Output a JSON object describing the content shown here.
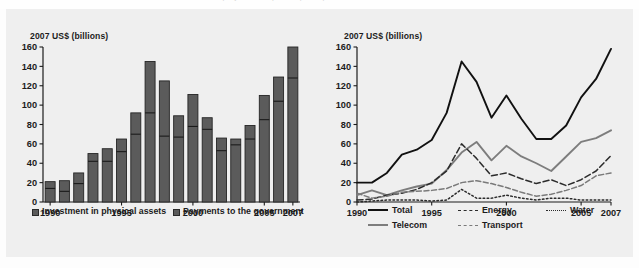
{
  "page": {
    "cropped_caption_ghost": "Investment in infrastructure projects with private participation"
  },
  "figure": {
    "left_panel": {
      "axis_title": "2007 US$ (billions)",
      "y_ticks": [
        "0",
        "20",
        "40",
        "60",
        "80",
        "100",
        "120",
        "140",
        "160"
      ],
      "x_ticks": [
        "1990",
        "1995",
        "2000",
        "2005",
        "2007"
      ],
      "legend": [
        {
          "label": "Investment in physical assets",
          "color": "#5b5b5b"
        },
        {
          "label": "Payments to the government",
          "color": "#5b5b5b"
        }
      ]
    },
    "right_panel": {
      "axis_title": "2007 US$ (billions)",
      "y_ticks": [
        "0",
        "20",
        "40",
        "60",
        "80",
        "100",
        "120",
        "140",
        "160"
      ],
      "x_ticks": [
        "1990",
        "1995",
        "2000",
        "2005",
        "2007"
      ],
      "legend": [
        {
          "label": "Total",
          "style": "solid",
          "color": "#111111"
        },
        {
          "label": "Energy",
          "style": "dashed",
          "color": "#2b2b2b"
        },
        {
          "label": "Water",
          "style": "dotted",
          "color": "#2b2b2b"
        },
        {
          "label": "Telecom",
          "style": "solid",
          "color": "#7d7d7d"
        },
        {
          "label": "Transport",
          "style": "dash-dot",
          "color": "#7a7a7a"
        }
      ]
    }
  },
  "chart_data": [
    {
      "type": "bar",
      "id": "stacked-bar-investment",
      "title": "",
      "xlabel": "",
      "ylabel": "2007 US$ (billions)",
      "ylim": [
        0,
        160
      ],
      "ytick_step": 20,
      "grid": false,
      "stacked": true,
      "categories": [
        1990,
        1991,
        1992,
        1993,
        1994,
        1995,
        1996,
        1997,
        1998,
        1999,
        2000,
        2001,
        2002,
        2003,
        2004,
        2005,
        2006,
        2007
      ],
      "series": [
        {
          "name": "Investment in physical assets",
          "values": [
            14,
            11,
            19,
            42,
            42,
            52,
            70,
            92,
            68,
            67,
            78,
            75,
            53,
            59,
            65,
            85,
            104,
            128
          ]
        },
        {
          "name": "Payments to the government",
          "values": [
            7,
            11,
            11,
            8,
            13,
            13,
            22,
            53,
            57,
            22,
            33,
            12,
            13,
            6,
            14,
            25,
            25,
            32
          ]
        }
      ],
      "totals": [
        21,
        22,
        30,
        50,
        55,
        65,
        92,
        145,
        125,
        89,
        111,
        87,
        66,
        65,
        79,
        110,
        129,
        160
      ]
    },
    {
      "type": "line",
      "id": "line-investment-by-sector",
      "title": "",
      "xlabel": "",
      "ylabel": "2007 US$ (billions)",
      "ylim": [
        0,
        160
      ],
      "ytick_step": 20,
      "grid": false,
      "x": [
        1990,
        1991,
        1992,
        1993,
        1994,
        1995,
        1996,
        1997,
        1998,
        1999,
        2000,
        2001,
        2002,
        2003,
        2004,
        2005,
        2006,
        2007
      ],
      "series": [
        {
          "name": "Total",
          "style": "solid",
          "color": "#111111",
          "values": [
            20,
            20,
            30,
            49,
            54,
            64,
            92,
            145,
            124,
            87,
            110,
            86,
            65,
            65,
            79,
            108,
            127,
            158
          ]
        },
        {
          "name": "Telecom",
          "style": "solid",
          "color": "#7d7d7d",
          "values": [
            7,
            12,
            7,
            12,
            16,
            19,
            33,
            51,
            62,
            43,
            58,
            47,
            40,
            32,
            47,
            62,
            66,
            74
          ]
        },
        {
          "name": "Energy",
          "style": "dashed",
          "color": "#2b2b2b",
          "values": [
            2,
            3,
            7,
            9,
            13,
            20,
            32,
            60,
            45,
            27,
            30,
            24,
            19,
            23,
            17,
            23,
            32,
            48
          ]
        },
        {
          "name": "Transport",
          "style": "dash-dot",
          "color": "#7a7a7a",
          "values": [
            9,
            4,
            6,
            10,
            11,
            12,
            14,
            20,
            22,
            19,
            15,
            10,
            6,
            8,
            12,
            17,
            27,
            30
          ]
        },
        {
          "name": "Water",
          "style": "dotted",
          "color": "#2b2b2b",
          "values": [
            0,
            1,
            2,
            2,
            2,
            1,
            2,
            13,
            4,
            4,
            7,
            4,
            2,
            4,
            4,
            2,
            2,
            2
          ]
        }
      ]
    }
  ]
}
